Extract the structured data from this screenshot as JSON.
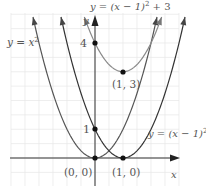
{
  "chart_data": {
    "type": "line",
    "title": "",
    "xlabel": "x",
    "ylabel": "y",
    "grid": true,
    "xlim": [
      -3,
      3
    ],
    "ylim": [
      -1,
      5
    ],
    "series": [
      {
        "name": "y = x^2",
        "label": "y = x²",
        "equation": "x^2",
        "color": "#555555"
      },
      {
        "name": "y = (x-1)^2",
        "label": "y = (x − 1)²",
        "equation": "(x-1)^2",
        "color": "#333333"
      },
      {
        "name": "y = (x-1)^2 + 3",
        "label": "y = (x − 1)² + 3",
        "equation": "(x-1)^2+3",
        "color": "#888888"
      }
    ],
    "points": [
      {
        "x": 0,
        "y": 0,
        "label": "(0, 0)"
      },
      {
        "x": 1,
        "y": 0,
        "label": "(1, 0)"
      },
      {
        "x": 1,
        "y": 3,
        "label": "(1, 3)"
      },
      {
        "x": 0,
        "y": 1,
        "label": "1"
      },
      {
        "x": 0,
        "y": 4,
        "label": "4"
      }
    ],
    "annotations": [
      "y = x²",
      "y = (x − 1)²",
      "y = (x − 1)² + 3",
      "(0, 0)",
      "(1, 0)",
      "(1, 3)",
      "1",
      "4",
      "x",
      "y"
    ]
  },
  "labels": {
    "curve_a": "y = x",
    "curve_a_exp": "2",
    "curve_b": "y = (x − 1)",
    "curve_b_exp": "2",
    "curve_c": "y = (x − 1)",
    "curve_c_exp": "2",
    "curve_c_tail": " + 3",
    "p00": "(0, 0)",
    "p10": "(1, 0)",
    "p13": "(1, 3)",
    "tick1": "1",
    "tick4": "4",
    "xaxis": "x",
    "yaxis": "y"
  }
}
